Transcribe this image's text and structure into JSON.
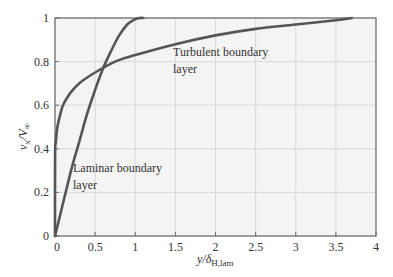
{
  "chart_data": {
    "type": "line",
    "title": "",
    "xlabel": "y/δ_H,lam",
    "xlabel_main": "y/δ",
    "xlabel_sub": "H,lam",
    "ylabel": "v_x/V_∞",
    "ylabel_main": "v",
    "ylabel_sub1": "x",
    "ylabel_mid": "/V",
    "ylabel_sub2": "∞",
    "xlim": [
      0,
      4
    ],
    "ylim": [
      0,
      1
    ],
    "grid": true,
    "legend": "none",
    "xticks": [
      "0",
      "0.5",
      "1",
      "1.5",
      "2",
      "2.5",
      "3",
      "3.5",
      "4"
    ],
    "yticks": [
      "0",
      "0.2",
      "0.4",
      "0.6",
      "0.8",
      "1"
    ],
    "series": [
      {
        "name": "Laminar boundary layer",
        "x": [
          0,
          0.1,
          0.2,
          0.3,
          0.4,
          0.5,
          0.6,
          0.7,
          0.8,
          0.9,
          1.0,
          1.06,
          1.1
        ],
        "y": [
          0,
          0.15,
          0.3,
          0.43,
          0.56,
          0.67,
          0.77,
          0.85,
          0.92,
          0.97,
          0.995,
          1.0,
          1.0
        ]
      },
      {
        "name": "Turbulent boundary layer",
        "x": [
          0,
          0.001,
          0.01,
          0.03,
          0.06,
          0.1,
          0.2,
          0.3,
          0.5,
          0.75,
          1.0,
          1.5,
          2.0,
          2.5,
          3.0,
          3.5,
          3.7
        ],
        "y": [
          0,
          0.37,
          0.43,
          0.5,
          0.55,
          0.6,
          0.66,
          0.7,
          0.75,
          0.8,
          0.83,
          0.88,
          0.92,
          0.95,
          0.97,
          0.99,
          1.0
        ]
      }
    ],
    "annotations": [
      {
        "text_line1": "Turbulent boundary",
        "text_line2": "layer",
        "x": 1.47,
        "y": 0.84
      },
      {
        "text_line1": "Laminar boundary",
        "text_line2": "layer",
        "x": 0.22,
        "y": 0.3
      }
    ]
  },
  "colors": {
    "curve": "#555555",
    "grid": "#d8d8d8",
    "plot_bg": "#f4f4f4",
    "frame": "#6b6b6b"
  }
}
